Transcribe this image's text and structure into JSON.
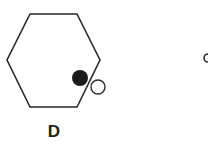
{
  "figure": {
    "option_label": "D",
    "shape": "hexagon",
    "filled_dot": "inside near lower-right edge",
    "open_dot": "outside lower-right edge"
  },
  "colors": {
    "stroke": "#2a2a2a",
    "fill_dot": "#1a1a1a",
    "background": "#ffffff"
  }
}
